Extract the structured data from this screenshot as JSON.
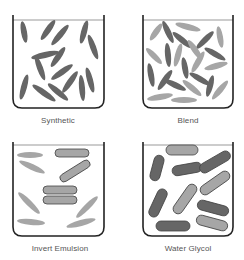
{
  "colors": {
    "beaker_stroke": "#222222",
    "liquid_line": "#999999",
    "dark_particle": "#666666",
    "light_particle": "#a6a6a6",
    "rod_stroke": "#444444",
    "label": "#555555"
  },
  "panels": [
    {
      "id": "synthetic",
      "label": "Synthetic",
      "beaker": {
        "x": 13,
        "y": 15,
        "w": 91,
        "h": 93,
        "liquid_y": 20
      },
      "label_pos": {
        "x": 3,
        "y": 116
      },
      "ellipses": [
        {
          "cx": 24,
          "cy": 32,
          "rx": 11,
          "ry": 3,
          "rot": 80,
          "tone": "dark"
        },
        {
          "cx": 48,
          "cy": 30,
          "rx": 12,
          "ry": 3,
          "rot": -55,
          "tone": "dark"
        },
        {
          "cx": 60,
          "cy": 35,
          "rx": 13,
          "ry": 3,
          "rot": -50,
          "tone": "dark"
        },
        {
          "cx": 84,
          "cy": 32,
          "rx": 12,
          "ry": 3,
          "rot": -75,
          "tone": "dark"
        },
        {
          "cx": 93,
          "cy": 47,
          "rx": 13,
          "ry": 3,
          "rot": 70,
          "tone": "dark"
        },
        {
          "cx": 45,
          "cy": 55,
          "rx": 14,
          "ry": 3,
          "rot": -12,
          "tone": "dark"
        },
        {
          "cx": 58,
          "cy": 57,
          "rx": 12,
          "ry": 3,
          "rot": -55,
          "tone": "dark"
        },
        {
          "cx": 40,
          "cy": 68,
          "rx": 13,
          "ry": 3,
          "rot": 70,
          "tone": "dark"
        },
        {
          "cx": 62,
          "cy": 72,
          "rx": 13,
          "ry": 3,
          "rot": -35,
          "tone": "dark"
        },
        {
          "cx": 70,
          "cy": 82,
          "rx": 13,
          "ry": 3,
          "rot": -55,
          "tone": "dark"
        },
        {
          "cx": 90,
          "cy": 80,
          "rx": 13,
          "ry": 3,
          "rot": 75,
          "tone": "dark"
        },
        {
          "cx": 82,
          "cy": 88,
          "rx": 13,
          "ry": 3,
          "rot": 85,
          "tone": "dark"
        },
        {
          "cx": 24,
          "cy": 87,
          "rx": 13,
          "ry": 3,
          "rot": -75,
          "tone": "dark"
        },
        {
          "cx": 44,
          "cy": 93,
          "rx": 14,
          "ry": 3,
          "rot": 35,
          "tone": "dark"
        },
        {
          "cx": 58,
          "cy": 92,
          "rx": 13,
          "ry": 3,
          "rot": 40,
          "tone": "dark"
        }
      ],
      "rods": []
    },
    {
      "id": "blend",
      "label": "Blend",
      "beaker": {
        "x": 143,
        "y": 15,
        "w": 90,
        "h": 93,
        "liquid_y": 20
      },
      "label_pos": {
        "x": 133,
        "y": 116
      },
      "ellipses": [
        {
          "cx": 156,
          "cy": 32,
          "rx": 10,
          "ry": 3,
          "rot": -55,
          "tone": "light"
        },
        {
          "cx": 168,
          "cy": 32,
          "rx": 12,
          "ry": 3,
          "rot": 65,
          "tone": "dark"
        },
        {
          "cx": 188,
          "cy": 27,
          "rx": 13,
          "ry": 3,
          "rot": 15,
          "tone": "light"
        },
        {
          "cx": 182,
          "cy": 40,
          "rx": 12,
          "ry": 3,
          "rot": 40,
          "tone": "dark"
        },
        {
          "cx": 205,
          "cy": 40,
          "rx": 12,
          "ry": 3,
          "rot": -45,
          "tone": "dark"
        },
        {
          "cx": 220,
          "cy": 37,
          "rx": 11,
          "ry": 3,
          "rot": 80,
          "tone": "light"
        },
        {
          "cx": 154,
          "cy": 56,
          "rx": 11,
          "ry": 3,
          "rot": 45,
          "tone": "light"
        },
        {
          "cx": 168,
          "cy": 55,
          "rx": 12,
          "ry": 3,
          "rot": 85,
          "tone": "dark"
        },
        {
          "cx": 178,
          "cy": 55,
          "rx": 12,
          "ry": 3,
          "rot": -75,
          "tone": "light"
        },
        {
          "cx": 195,
          "cy": 50,
          "rx": 12,
          "ry": 3,
          "rot": 55,
          "tone": "light"
        },
        {
          "cx": 215,
          "cy": 54,
          "rx": 12,
          "ry": 3,
          "rot": 30,
          "tone": "dark"
        },
        {
          "cx": 198,
          "cy": 62,
          "rx": 12,
          "ry": 3,
          "rot": -60,
          "tone": "light"
        },
        {
          "cx": 185,
          "cy": 68,
          "rx": 11,
          "ry": 3,
          "rot": 80,
          "tone": "dark"
        },
        {
          "cx": 216,
          "cy": 66,
          "rx": 12,
          "ry": 3,
          "rot": -15,
          "tone": "light"
        },
        {
          "cx": 151,
          "cy": 75,
          "rx": 12,
          "ry": 3,
          "rot": 80,
          "tone": "dark"
        },
        {
          "cx": 165,
          "cy": 80,
          "rx": 12,
          "ry": 3,
          "rot": -55,
          "tone": "dark"
        },
        {
          "cx": 175,
          "cy": 85,
          "rx": 12,
          "ry": 3,
          "rot": 25,
          "tone": "dark"
        },
        {
          "cx": 200,
          "cy": 79,
          "rx": 12,
          "ry": 3,
          "rot": 30,
          "tone": "dark"
        },
        {
          "cx": 210,
          "cy": 86,
          "rx": 11,
          "ry": 3,
          "rot": -75,
          "tone": "dark"
        },
        {
          "cx": 192,
          "cy": 88,
          "rx": 12,
          "ry": 3,
          "rot": 40,
          "tone": "light"
        },
        {
          "cx": 160,
          "cy": 97,
          "rx": 13,
          "ry": 3,
          "rot": -10,
          "tone": "light"
        },
        {
          "cx": 184,
          "cy": 100,
          "rx": 13,
          "ry": 3,
          "rot": 0,
          "tone": "light"
        },
        {
          "cx": 220,
          "cy": 90,
          "rx": 12,
          "ry": 3,
          "rot": -50,
          "tone": "light"
        }
      ],
      "rods": []
    },
    {
      "id": "invert-emulsion",
      "label": "Invert Emulsion",
      "beaker": {
        "x": 13,
        "y": 142,
        "w": 91,
        "h": 94,
        "liquid_y": 145
      },
      "label_pos": {
        "x": 5,
        "y": 244
      },
      "ellipses": [
        {
          "cx": 30,
          "cy": 155,
          "rx": 13,
          "ry": 3,
          "rot": 0,
          "tone": "light"
        },
        {
          "cx": 32,
          "cy": 167,
          "rx": 14,
          "ry": 3,
          "rot": 25,
          "tone": "light"
        },
        {
          "cx": 29,
          "cy": 203,
          "rx": 15,
          "ry": 3,
          "rot": 45,
          "tone": "light"
        },
        {
          "cx": 31,
          "cy": 222,
          "rx": 14,
          "ry": 3,
          "rot": 5,
          "tone": "light"
        },
        {
          "cx": 87,
          "cy": 207,
          "rx": 15,
          "ry": 3,
          "rot": -45,
          "tone": "light"
        },
        {
          "cx": 81,
          "cy": 223,
          "rx": 15,
          "ry": 3,
          "rot": -15,
          "tone": "light"
        }
      ],
      "rods": [
        {
          "cx": 72,
          "cy": 153,
          "len": 34,
          "w": 8,
          "rot": 0,
          "tone": "light"
        },
        {
          "cx": 75,
          "cy": 171,
          "len": 34,
          "w": 8,
          "rot": -32,
          "tone": "light"
        },
        {
          "cx": 60,
          "cy": 190,
          "len": 34,
          "w": 8,
          "rot": 0,
          "tone": "light"
        },
        {
          "cx": 60,
          "cy": 200,
          "len": 34,
          "w": 8,
          "rot": 0,
          "tone": "light"
        }
      ]
    },
    {
      "id": "water-glycol",
      "label": "Water Glycol",
      "beaker": {
        "x": 143,
        "y": 142,
        "w": 90,
        "h": 94,
        "liquid_y": 145
      },
      "label_pos": {
        "x": 133,
        "y": 244
      },
      "ellipses": [],
      "rods": [
        {
          "cx": 157,
          "cy": 168,
          "len": 26,
          "w": 10,
          "rot": -75,
          "tone": "dark"
        },
        {
          "cx": 182,
          "cy": 150,
          "len": 32,
          "w": 10,
          "rot": 0,
          "tone": "light"
        },
        {
          "cx": 187,
          "cy": 169,
          "len": 30,
          "w": 10,
          "rot": -10,
          "tone": "dark"
        },
        {
          "cx": 215,
          "cy": 162,
          "len": 34,
          "w": 10,
          "rot": -30,
          "tone": "dark"
        },
        {
          "cx": 215,
          "cy": 183,
          "len": 34,
          "w": 10,
          "rot": -35,
          "tone": "light"
        },
        {
          "cx": 158,
          "cy": 203,
          "len": 30,
          "w": 10,
          "rot": -65,
          "tone": "dark"
        },
        {
          "cx": 185,
          "cy": 199,
          "len": 34,
          "w": 10,
          "rot": -55,
          "tone": "light"
        },
        {
          "cx": 213,
          "cy": 208,
          "len": 32,
          "w": 10,
          "rot": 15,
          "tone": "dark"
        },
        {
          "cx": 212,
          "cy": 223,
          "len": 32,
          "w": 10,
          "rot": 15,
          "tone": "light"
        },
        {
          "cx": 173,
          "cy": 226,
          "len": 34,
          "w": 10,
          "rot": 0,
          "tone": "dark"
        }
      ]
    }
  ]
}
